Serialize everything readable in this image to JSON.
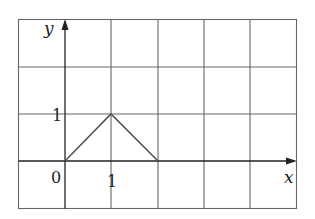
{
  "diagram": {
    "type": "coordinate-grid-plot",
    "grid": {
      "columns": 6,
      "rows": 4,
      "cell_px": 46.5
    },
    "axes": {
      "x_label": "x",
      "y_label": "y",
      "origin_label": "0",
      "x_tick_label": "1",
      "y_tick_label": "1"
    },
    "polyline": {
      "points": [
        [
          0,
          0
        ],
        [
          1,
          1
        ],
        [
          2,
          0
        ]
      ],
      "color": "#555555"
    },
    "colors": {
      "grid": "#666666",
      "axis": "#222222"
    }
  }
}
